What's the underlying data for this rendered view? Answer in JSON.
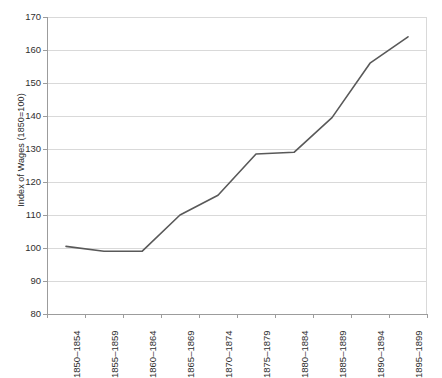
{
  "chart_data": {
    "type": "line",
    "title": "",
    "xlabel": "",
    "ylabel": "Index of Wages (1850=100)",
    "categories": [
      "1850–1854",
      "1855–1859",
      "1860–1864",
      "1865–1869",
      "1870–1874",
      "1875–1879",
      "1880–1884",
      "1885–1889",
      "1890–1894",
      "1895–1899"
    ],
    "values": [
      100.5,
      99,
      99,
      110,
      116,
      128.5,
      129,
      139.5,
      156,
      164
    ],
    "series": [
      {
        "name": "Index of Wages",
        "values": [
          100.5,
          99,
          99,
          110,
          116,
          128.5,
          129,
          139.5,
          156,
          164
        ]
      }
    ],
    "ylim": [
      80,
      170
    ],
    "yticks": [
      80,
      90,
      100,
      110,
      120,
      130,
      140,
      150,
      160,
      170
    ],
    "ytick_labels": [
      "80",
      "90",
      "100",
      "110",
      "120",
      "130",
      "140",
      "150",
      "160",
      "170"
    ],
    "grid": "horizontal",
    "legend": "none",
    "line_color": "#595959",
    "grid_color": "#d9d9d9",
    "axis_color": "#9c9c9c",
    "text_color": "#2f2f2f",
    "background": "#ffffff"
  }
}
